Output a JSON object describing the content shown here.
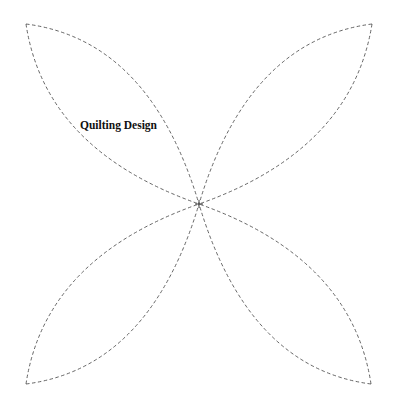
{
  "title": "Quilting Design",
  "design": {
    "center": [
      199,
      204
    ],
    "corners": {
      "top_left": [
        26,
        24
      ],
      "top_right": [
        372,
        24
      ],
      "bottom_left": [
        26,
        384
      ],
      "bottom_right": [
        371,
        384
      ]
    },
    "petals": [
      {
        "name": "top-left-petal"
      },
      {
        "name": "top-right-petal"
      },
      {
        "name": "bottom-left-petal"
      },
      {
        "name": "bottom-right-petal"
      }
    ],
    "line_style": "dashed",
    "line_color": "#555555"
  }
}
